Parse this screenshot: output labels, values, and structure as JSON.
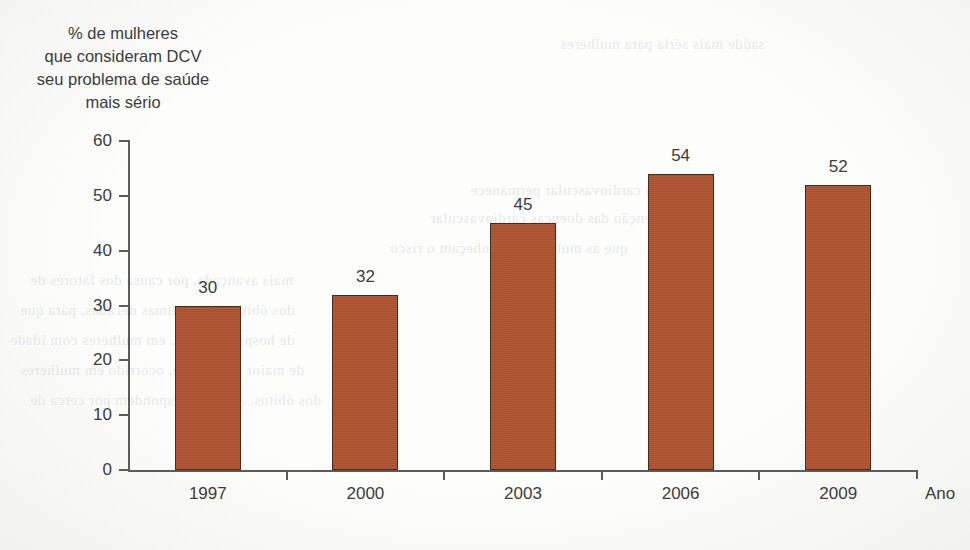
{
  "chart_data": {
    "type": "bar",
    "title": "",
    "ylabel_lines": [
      "% de mulheres",
      "que consideram DCV",
      "seu problema de saúde",
      "mais sério"
    ],
    "ylabel": "% de mulheres que consideram DCV seu problema de saúde mais sério",
    "xlabel": "Ano",
    "categories": [
      "1997",
      "2000",
      "2003",
      "2006",
      "2009"
    ],
    "values": [
      30,
      32,
      45,
      54,
      52
    ],
    "value_labels": [
      "30",
      "32",
      "45",
      "54",
      "52"
    ],
    "ylim": [
      0,
      60
    ],
    "y_ticks": [
      0,
      10,
      20,
      30,
      40,
      50,
      60
    ],
    "y_tick_labels": [
      "0",
      "10",
      "20",
      "30",
      "40",
      "50",
      "60"
    ],
    "grid": false,
    "legend": null,
    "legend_position": "none",
    "series": [
      {
        "name": "% de mulheres que consideram DCV seu problema de saúde mais sério",
        "values": [
          30,
          32,
          45,
          54,
          52
        ]
      }
    ]
  },
  "colors": {
    "bar_fill": "#ae5230",
    "bar_outline": "#4a2a1c",
    "axis": "#5b5b5b",
    "text": "#3c3c3c",
    "background": "#fdfdfb"
  },
  "scan": {
    "bleed_lines": [
      "saúde mais séria para mulheres",
      "a doença cardiovascular permanece",
      "prevenção das doenças cardiovascular",
      "que as mulheres reconheçam o risco",
      "mais avançada, por causa dos fatores de",
      "dos óbitos. Nas últimas décadas, para que",
      "de hospitalizações, em mulheres com idade",
      "de maior morbidade, ocorrido em mulheres",
      "dos óbitos. As DCV respondem por cerca de"
    ]
  }
}
